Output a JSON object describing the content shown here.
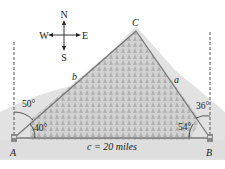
{
  "diagram": {
    "type": "triangle-navigation",
    "compass": {
      "north": "N",
      "south": "S",
      "east": "E",
      "west": "W"
    },
    "vertices": {
      "A": "A",
      "B": "B",
      "C": "C"
    },
    "sides": {
      "a": "a",
      "b": "b",
      "c": "c = 20 miles"
    },
    "angles": {
      "A_bearing": "50°",
      "A_interior": "40°",
      "B_bearing": "36°",
      "B_interior": "54°"
    },
    "colors": {
      "line": "#777777",
      "text": "#1a1a1a",
      "terrain": "#c8c8c8"
    }
  }
}
